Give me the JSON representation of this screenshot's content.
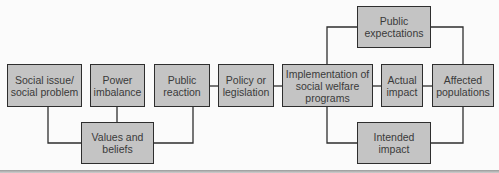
{
  "diagram": {
    "type": "flowchart",
    "colors": {
      "box_fill": "#c4c4c4",
      "box_border": "#2e2e2e",
      "line": "#2e2e2e",
      "text": "#3a3a3a",
      "background": "#fbfbfb"
    },
    "nodes": {
      "social_issue": {
        "label": "Social issue/ social problem"
      },
      "power_imbalance": {
        "label": "Power imbalance"
      },
      "public_reaction": {
        "label": "Public reaction"
      },
      "policy": {
        "label": "Policy or legislation"
      },
      "implementation": {
        "label": "Implementation of social welfare programs"
      },
      "actual_impact": {
        "label": "Actual impact"
      },
      "affected_populations": {
        "label": "Affected populations"
      },
      "public_expectations": {
        "label": "Public expectations"
      },
      "values_beliefs": {
        "label": "Values and beliefs"
      },
      "intended_impact": {
        "label": "Intended impact"
      }
    },
    "edges": [
      [
        "social_issue",
        "values_beliefs"
      ],
      [
        "power_imbalance",
        "values_beliefs"
      ],
      [
        "public_reaction",
        "values_beliefs"
      ],
      [
        "public_reaction",
        "policy"
      ],
      [
        "policy",
        "implementation"
      ],
      [
        "implementation",
        "actual_impact"
      ],
      [
        "actual_impact",
        "affected_populations"
      ],
      [
        "implementation",
        "public_expectations"
      ],
      [
        "public_expectations",
        "affected_populations"
      ],
      [
        "implementation",
        "intended_impact"
      ],
      [
        "intended_impact",
        "affected_populations"
      ]
    ]
  }
}
